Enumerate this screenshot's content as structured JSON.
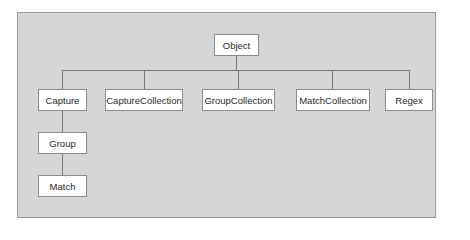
{
  "diagram": {
    "type": "class-hierarchy",
    "root": {
      "id": "object",
      "label": "Object"
    },
    "children_of_root": [
      {
        "id": "capture",
        "label": "Capture"
      },
      {
        "id": "capture-collection",
        "label": "CaptureCollection"
      },
      {
        "id": "group-collection",
        "label": "GroupCollection"
      },
      {
        "id": "match-collection",
        "label": "MatchCollection"
      },
      {
        "id": "regex",
        "label": "Regex"
      }
    ],
    "chain": [
      {
        "id": "group",
        "label": "Group",
        "parent": "capture"
      },
      {
        "id": "match",
        "label": "Match",
        "parent": "group"
      }
    ],
    "edges": [
      [
        "object",
        "capture"
      ],
      [
        "object",
        "capture-collection"
      ],
      [
        "object",
        "group-collection"
      ],
      [
        "object",
        "match-collection"
      ],
      [
        "object",
        "regex"
      ],
      [
        "capture",
        "group"
      ],
      [
        "group",
        "match"
      ]
    ],
    "colors": {
      "background": "#d6d6d6",
      "node_fill": "#ffffff",
      "node_border": "#8c8c8c",
      "connector": "#777777"
    }
  }
}
